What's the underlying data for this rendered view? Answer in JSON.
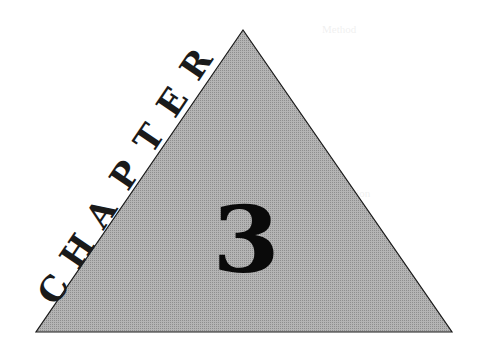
{
  "chapter": {
    "word": "CHAPTER",
    "letters": [
      "C",
      "H",
      "A",
      "P",
      "T",
      "E",
      "R"
    ],
    "number": "3"
  },
  "graphic": {
    "shape": "triangle",
    "fill": "#a8a8a8",
    "stroke": "#1a1a1a",
    "vertices": {
      "apex": [
        243,
        30
      ],
      "bottom_left": [
        36,
        332
      ],
      "bottom_right": [
        452,
        332
      ]
    }
  },
  "bleed_through": {
    "lines": [
      "Method",
      "...",
      "Discussion"
    ]
  },
  "colors": {
    "background": "#ffffff",
    "triangle_fill": "#a8a8a8",
    "text": "#111111"
  }
}
